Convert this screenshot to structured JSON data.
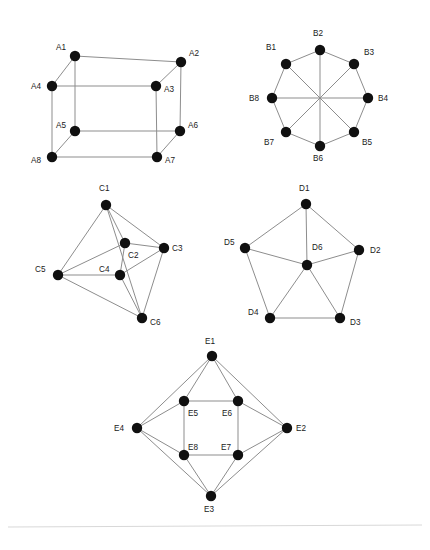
{
  "figure": {
    "background_color": "#ffffff",
    "node_color": "#101010",
    "edge_color": "#8d8d8d",
    "label_color": "#1a1a1a",
    "node_radius": 5.2,
    "edge_width": 1,
    "width": 430,
    "height": 550,
    "footer_rule_color": "#d8d8d8"
  },
  "graphs": [
    {
      "id": "graph-a",
      "name": "cube-graph",
      "nodes": [
        {
          "id": "A1",
          "label": "A1",
          "x": 75,
          "y": 56,
          "label_x": 56,
          "label_y": 50
        },
        {
          "id": "A2",
          "label": "A2",
          "x": 181,
          "y": 62,
          "label_x": 189,
          "label_y": 56
        },
        {
          "id": "A3",
          "label": "A3",
          "x": 156,
          "y": 86,
          "label_x": 164,
          "label_y": 92
        },
        {
          "id": "A4",
          "label": "A4",
          "x": 52,
          "y": 86,
          "label_x": 31,
          "label_y": 89
        },
        {
          "id": "A5",
          "label": "A5",
          "x": 75,
          "y": 131,
          "label_x": 56,
          "label_y": 128
        },
        {
          "id": "A6",
          "label": "A6",
          "x": 180,
          "y": 131,
          "label_x": 188,
          "label_y": 128
        },
        {
          "id": "A7",
          "label": "A7",
          "x": 157,
          "y": 157,
          "label_x": 165,
          "label_y": 163
        },
        {
          "id": "A8",
          "label": "A8",
          "x": 52,
          "y": 157,
          "label_x": 31,
          "label_y": 163
        }
      ],
      "edges": [
        [
          "A1",
          "A2"
        ],
        [
          "A1",
          "A4"
        ],
        [
          "A1",
          "A5"
        ],
        [
          "A2",
          "A3"
        ],
        [
          "A2",
          "A6"
        ],
        [
          "A3",
          "A4"
        ],
        [
          "A3",
          "A7"
        ],
        [
          "A4",
          "A8"
        ],
        [
          "A5",
          "A6"
        ],
        [
          "A5",
          "A8"
        ],
        [
          "A6",
          "A7"
        ],
        [
          "A7",
          "A8"
        ]
      ]
    },
    {
      "id": "graph-b",
      "name": "octagon-with-diagonals-graph",
      "nodes": [
        {
          "id": "B1",
          "label": "B1",
          "x": 286,
          "y": 64,
          "label_x": 266,
          "label_y": 50
        },
        {
          "id": "B2",
          "label": "B2",
          "x": 320,
          "y": 50,
          "label_x": 313,
          "label_y": 36
        },
        {
          "id": "B3",
          "label": "B3",
          "x": 354,
          "y": 64,
          "label_x": 364,
          "label_y": 55
        },
        {
          "id": "B4",
          "label": "B4",
          "x": 368,
          "y": 98,
          "label_x": 378,
          "label_y": 101
        },
        {
          "id": "B5",
          "label": "B5",
          "x": 354,
          "y": 132,
          "label_x": 362,
          "label_y": 145
        },
        {
          "id": "B6",
          "label": "B6",
          "x": 320,
          "y": 146,
          "label_x": 313,
          "label_y": 161
        },
        {
          "id": "B7",
          "label": "B7",
          "x": 286,
          "y": 132,
          "label_x": 264,
          "label_y": 145
        },
        {
          "id": "B8",
          "label": "B8",
          "x": 272,
          "y": 98,
          "label_x": 249,
          "label_y": 101
        }
      ],
      "edges": [
        [
          "B1",
          "B2"
        ],
        [
          "B2",
          "B3"
        ],
        [
          "B3",
          "B4"
        ],
        [
          "B4",
          "B5"
        ],
        [
          "B5",
          "B6"
        ],
        [
          "B6",
          "B7"
        ],
        [
          "B7",
          "B8"
        ],
        [
          "B8",
          "B1"
        ],
        [
          "B1",
          "B5"
        ],
        [
          "B2",
          "B6"
        ],
        [
          "B3",
          "B7"
        ],
        [
          "B4",
          "B8"
        ]
      ]
    },
    {
      "id": "graph-c",
      "name": "irregular-six-node-graph",
      "nodes": [
        {
          "id": "C1",
          "label": "C1",
          "x": 106,
          "y": 205,
          "label_x": 99,
          "label_y": 191
        },
        {
          "id": "C2",
          "label": "C2",
          "x": 125,
          "y": 243,
          "label_x": 128,
          "label_y": 258
        },
        {
          "id": "C3",
          "label": "C3",
          "x": 164,
          "y": 248,
          "label_x": 172,
          "label_y": 251
        },
        {
          "id": "C4",
          "label": "C4",
          "x": 120,
          "y": 275,
          "label_x": 99,
          "label_y": 272
        },
        {
          "id": "C5",
          "label": "C5",
          "x": 58,
          "y": 275,
          "label_x": 35,
          "label_y": 272
        },
        {
          "id": "C6",
          "label": "C6",
          "x": 142,
          "y": 318,
          "label_x": 150,
          "label_y": 325
        }
      ],
      "edges": [
        [
          "C1",
          "C2"
        ],
        [
          "C1",
          "C3"
        ],
        [
          "C1",
          "C5"
        ],
        [
          "C1",
          "C6"
        ],
        [
          "C2",
          "C3"
        ],
        [
          "C2",
          "C4"
        ],
        [
          "C2",
          "C5"
        ],
        [
          "C3",
          "C4"
        ],
        [
          "C3",
          "C6"
        ],
        [
          "C4",
          "C5"
        ],
        [
          "C4",
          "C6"
        ],
        [
          "C5",
          "C6"
        ]
      ]
    },
    {
      "id": "graph-d",
      "name": "wheel-graph",
      "nodes": [
        {
          "id": "D1",
          "label": "D1",
          "x": 306,
          "y": 204,
          "label_x": 299,
          "label_y": 191
        },
        {
          "id": "D2",
          "label": "D2",
          "x": 359,
          "y": 250,
          "label_x": 370,
          "label_y": 253
        },
        {
          "id": "D3",
          "label": "D3",
          "x": 340,
          "y": 318,
          "label_x": 350,
          "label_y": 325
        },
        {
          "id": "D4",
          "label": "D4",
          "x": 270,
          "y": 318,
          "label_x": 248,
          "label_y": 315
        },
        {
          "id": "D5",
          "label": "D5",
          "x": 245,
          "y": 248,
          "label_x": 224,
          "label_y": 245
        },
        {
          "id": "D6",
          "label": "D6",
          "x": 307,
          "y": 265,
          "label_x": 312,
          "label_y": 250
        }
      ],
      "edges": [
        [
          "D1",
          "D2"
        ],
        [
          "D2",
          "D3"
        ],
        [
          "D3",
          "D4"
        ],
        [
          "D4",
          "D5"
        ],
        [
          "D5",
          "D1"
        ],
        [
          "D6",
          "D1"
        ],
        [
          "D6",
          "D2"
        ],
        [
          "D6",
          "D3"
        ],
        [
          "D6",
          "D4"
        ],
        [
          "D6",
          "D5"
        ]
      ]
    },
    {
      "id": "graph-e",
      "name": "antiprism-diamond-graph",
      "nodes": [
        {
          "id": "E1",
          "label": "E1",
          "x": 212,
          "y": 356,
          "label_x": 205,
          "label_y": 344
        },
        {
          "id": "E2",
          "label": "E2",
          "x": 287,
          "y": 428,
          "label_x": 296,
          "label_y": 431
        },
        {
          "id": "E3",
          "label": "E3",
          "x": 211,
          "y": 496,
          "label_x": 204,
          "label_y": 512
        },
        {
          "id": "E4",
          "label": "E4",
          "x": 137,
          "y": 428,
          "label_x": 114,
          "label_y": 431
        },
        {
          "id": "E5",
          "label": "E5",
          "x": 184,
          "y": 401,
          "label_x": 188,
          "label_y": 416
        },
        {
          "id": "E6",
          "label": "E6",
          "x": 238,
          "y": 401,
          "label_x": 222,
          "label_y": 416
        },
        {
          "id": "E7",
          "label": "E7",
          "x": 238,
          "y": 455,
          "label_x": 221,
          "label_y": 450
        },
        {
          "id": "E8",
          "label": "E8",
          "x": 184,
          "y": 455,
          "label_x": 188,
          "label_y": 450
        }
      ],
      "edges": [
        [
          "E1",
          "E2"
        ],
        [
          "E2",
          "E3"
        ],
        [
          "E3",
          "E4"
        ],
        [
          "E4",
          "E1"
        ],
        [
          "E5",
          "E6"
        ],
        [
          "E6",
          "E7"
        ],
        [
          "E7",
          "E8"
        ],
        [
          "E8",
          "E5"
        ],
        [
          "E1",
          "E5"
        ],
        [
          "E1",
          "E6"
        ],
        [
          "E2",
          "E6"
        ],
        [
          "E2",
          "E7"
        ],
        [
          "E3",
          "E7"
        ],
        [
          "E3",
          "E8"
        ],
        [
          "E4",
          "E8"
        ],
        [
          "E4",
          "E5"
        ]
      ]
    }
  ],
  "footer": {
    "rule": {
      "x1": 8,
      "y1": 527,
      "x2": 422,
      "y2": 525
    }
  }
}
